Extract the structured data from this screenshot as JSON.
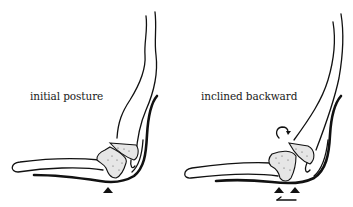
{
  "figures": [
    {
      "id": "left",
      "label": "initial posture",
      "support_markers": 1,
      "rotation_arrow": false,
      "translation_arrow": false
    },
    {
      "id": "right",
      "label": "inclined backward",
      "support_markers": 2,
      "rotation_arrow": true,
      "translation_arrow": true
    }
  ],
  "colors": {
    "line": "#111111",
    "bone_fill": "#e6e6e6",
    "background": "#ffffff"
  }
}
